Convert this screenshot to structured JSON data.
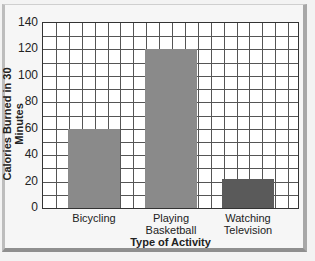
{
  "chart_data": {
    "type": "bar",
    "title": "",
    "categories": [
      "Bicycling",
      "Playing Basketball",
      "Watching Television"
    ],
    "category_lines": [
      [
        "Bicycling"
      ],
      [
        "Playing",
        "Basketball"
      ],
      [
        "Watching",
        "Television"
      ]
    ],
    "values": [
      60,
      120,
      22
    ],
    "colors": [
      "#8a8a8a",
      "#8a8a8a",
      "#5a5a5a"
    ],
    "xlabel": "Type of Activity",
    "ylabel": "Calories Burned in 30 Minutes",
    "ylim": [
      0,
      140
    ],
    "yticks": [
      0,
      20,
      40,
      60,
      80,
      100,
      120,
      140
    ],
    "grid": true,
    "legend": null
  }
}
